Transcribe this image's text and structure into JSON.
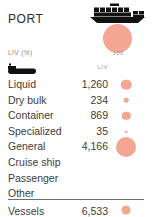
{
  "header": {
    "title": "PORT",
    "ship_icon": "container-ship-icon",
    "bubble_value": "100",
    "unit_label": "LIV (%)"
  },
  "table": {
    "row_icon": "tanker-boat-icon",
    "column_header": "LIV",
    "rows": [
      {
        "label": "Liquid",
        "value": "1,260",
        "dot": 10.5
      },
      {
        "label": "Dry bulk",
        "value": "234",
        "dot": 4.5
      },
      {
        "label": "Container",
        "value": "869",
        "dot": 8.5
      },
      {
        "label": "Specialized",
        "value": "35",
        "dot": 2.6
      },
      {
        "label": "General",
        "value": "4,166",
        "dot": 20.0
      },
      {
        "label": "Cruise ship",
        "value": "",
        "dot": 0
      },
      {
        "label": "Passenger",
        "value": "",
        "dot": 0
      },
      {
        "label": "Other",
        "value": "",
        "dot": 0
      }
    ]
  },
  "footer": {
    "label": "Vessels",
    "value": "6,533",
    "dot": 9.0
  },
  "colors": {
    "bubble": "#f5a594",
    "text": "#3c3c3c",
    "muted": "#9a9a9a",
    "rule": "#6e6e6e",
    "background": "#ffffff"
  },
  "chart_data": {
    "type": "bar",
    "title": "PORT",
    "subtitle": "LIV (%)",
    "xlabel": "",
    "ylabel": "",
    "legend": [],
    "annotations": [
      "100"
    ],
    "categories": [
      "Liquid",
      "Dry bulk",
      "Container",
      "Specialized",
      "General",
      "Cruise ship",
      "Passenger",
      "Other"
    ],
    "series": [
      {
        "name": "LIV",
        "values": [
          1260,
          234,
          869,
          35,
          4166,
          null,
          null,
          null
        ]
      }
    ],
    "total": {
      "label": "Vessels",
      "value": 6533
    },
    "encoding": "proportional-circle-area",
    "grid": false
  }
}
